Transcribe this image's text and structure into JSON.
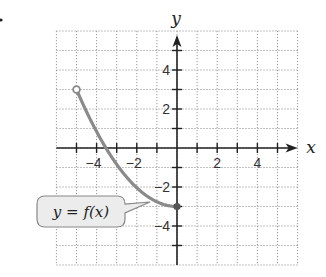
{
  "chart_data": {
    "type": "line",
    "title": "",
    "xlabel": "x",
    "ylabel": "y",
    "xlim": [
      -6,
      6
    ],
    "ylim": [
      -6,
      6
    ],
    "grid": true,
    "grid_style": "dotted",
    "x_ticks": [
      -4,
      -2,
      2,
      4
    ],
    "y_ticks": [
      4,
      2,
      -2,
      -4
    ],
    "x_tick_labels": [
      "−4",
      "−2",
      "2",
      "4"
    ],
    "y_tick_labels": [
      "4",
      "2",
      "−2",
      "−4"
    ],
    "series": [
      {
        "name": "y = f(x)",
        "x": [
          -5,
          -4,
          -3,
          -2,
          -1,
          0
        ],
        "y": [
          3,
          0.84,
          -0.84,
          -2.04,
          -2.76,
          -3
        ],
        "start_point": {
          "x": -5,
          "y": 3,
          "style": "open"
        },
        "end_point": {
          "x": 0,
          "y": -3,
          "style": "closed"
        }
      }
    ],
    "annotations": [
      {
        "text": "y = f(x)",
        "points_to": {
          "x": -1.3,
          "y": -2.7
        }
      }
    ]
  },
  "labels": {
    "x_axis": "x",
    "y_axis": "y",
    "function": "y = f(x)"
  },
  "colors": {
    "curve": "#8a8a8a",
    "axis": "#222222",
    "grid": "#999999",
    "callout_fill": "#ececec",
    "callout_stroke": "#888888"
  }
}
